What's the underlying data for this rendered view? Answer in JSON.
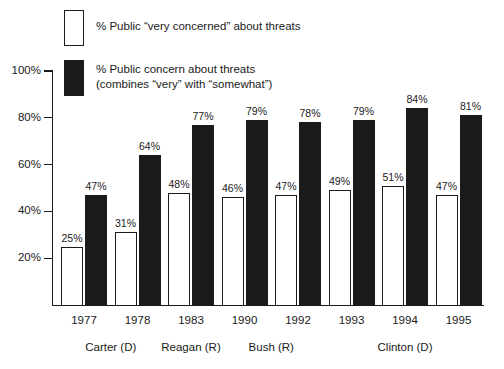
{
  "legend": {
    "items": [
      {
        "swatch": "open",
        "label": "% Public “very concerned” about threats"
      },
      {
        "swatch": "filled",
        "label": "% Public concern about threats\n(combines “very” with “somewhat”)"
      }
    ]
  },
  "chart_data": {
    "type": "bar",
    "title": "",
    "subtitle": "",
    "xlabel": "",
    "ylabel": "",
    "ylim": [
      0,
      100
    ],
    "yticks": [
      "20%",
      "40%",
      "60%",
      "80%",
      "100%"
    ],
    "ytick_values": [
      20,
      40,
      60,
      80,
      100
    ],
    "grid": false,
    "legend_position": "top-left",
    "categories": [
      "1977",
      "1978",
      "1983",
      "1990",
      "1992",
      "1993",
      "1994",
      "1995"
    ],
    "series": [
      {
        "name": "% Public “very concerned” about threats",
        "style": "open",
        "values": [
          25,
          31,
          48,
          46,
          47,
          49,
          51,
          47
        ],
        "labels": [
          "25%",
          "31%",
          "48%",
          "46%",
          "47%",
          "49%",
          "51%",
          "47%"
        ]
      },
      {
        "name": "% Public concern about threats (combines “very” with “somewhat”)",
        "style": "filled",
        "values": [
          47,
          64,
          77,
          79,
          78,
          79,
          84,
          81
        ],
        "labels": [
          "47%",
          "64%",
          "77%",
          "79%",
          "78%",
          "79%",
          "84%",
          "81%"
        ]
      }
    ],
    "group_annotations": [
      {
        "label": "Carter (D)",
        "years": [
          "1977",
          "1978"
        ]
      },
      {
        "label": "Reagan (R)",
        "years": [
          "1983"
        ]
      },
      {
        "label": "Bush (R)",
        "years": [
          "1990",
          "1992"
        ]
      },
      {
        "label": "Clinton (D)",
        "years": [
          "1993",
          "1994",
          "1995"
        ]
      }
    ],
    "colors": {
      "open_fill": "#ffffff",
      "filled_fill": "#1a1a1a",
      "axis": "#1a1a1a",
      "text": "#1a1a1a"
    }
  },
  "annotations": {
    "presidents": [
      "Carter (D)",
      "Reagan (R)",
      "Bush (R)",
      "Clinton (D)"
    ]
  }
}
